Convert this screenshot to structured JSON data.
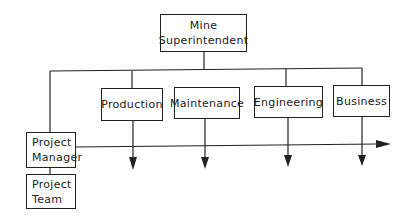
{
  "diagram": {
    "type": "organization-chart",
    "top": {
      "line1": "Mine",
      "line2": "Superintendent"
    },
    "departments": [
      {
        "label": "Production"
      },
      {
        "label": "Maintenance"
      },
      {
        "label": "Engineering"
      },
      {
        "label": "Business"
      }
    ],
    "project_manager": {
      "line1": "Project",
      "line2": "Manager"
    },
    "project_team": {
      "line1": "Project",
      "line2": "Team"
    },
    "colors": {
      "line": "#222222",
      "background": "#ffffff"
    }
  }
}
